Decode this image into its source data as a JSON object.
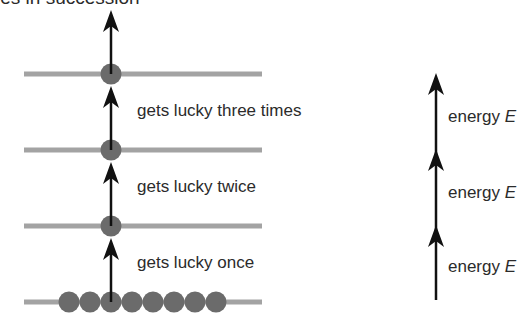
{
  "title_fragment": "ies in succession",
  "colors": {
    "level_line": "#a3a3a3",
    "ball": "#6b6b6b",
    "arrow": "#111111",
    "text": "#2b2b2b"
  },
  "left_panel": {
    "levels": 4,
    "ground_ball_count": 8,
    "steps": [
      {
        "label": "gets lucky once"
      },
      {
        "label": "gets lucky twice"
      },
      {
        "label": "gets lucky three times"
      }
    ]
  },
  "right_panel": {
    "steps": [
      {
        "label": "energy ",
        "symbol": "E"
      },
      {
        "label": "energy ",
        "symbol": "E"
      },
      {
        "label": "energy ",
        "symbol": "E"
      }
    ]
  }
}
